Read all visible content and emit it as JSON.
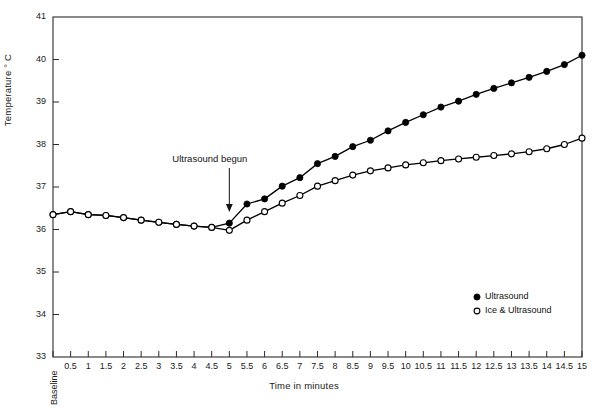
{
  "chart_data": {
    "type": "line",
    "title": "",
    "xlabel": "Time in minutes",
    "ylabel": "Temperature ° C",
    "ylim": [
      33,
      41
    ],
    "yticks": [
      33,
      34,
      35,
      36,
      37,
      38,
      39,
      40,
      41
    ],
    "grid": false,
    "legend_position": "lower-right",
    "categories": [
      "Baseline",
      "0.5",
      "1",
      "1.5",
      "2",
      "2.5",
      "3",
      "3.5",
      "4",
      "4.5",
      "5",
      "5.5",
      "6",
      "6.5",
      "7",
      "7.5",
      "8",
      "8.5",
      "9",
      "9.5",
      "10",
      "10.5",
      "11",
      "11.5",
      "12",
      "12.5",
      "13",
      "13.5",
      "14",
      "14.5",
      "15"
    ],
    "annotations": [
      {
        "text": "Ultrasound begun",
        "at_category": "5",
        "marker": "down-arrow"
      }
    ],
    "series": [
      {
        "name": "Ultrasound",
        "marker": "filled-circle",
        "color": "#000000",
        "values": [
          36.35,
          36.42,
          36.35,
          36.33,
          36.28,
          36.22,
          36.17,
          36.12,
          36.08,
          36.05,
          36.15,
          36.6,
          36.72,
          37.02,
          37.22,
          37.55,
          37.72,
          37.95,
          38.1,
          38.32,
          38.52,
          38.7,
          38.88,
          39.02,
          39.18,
          39.32,
          39.45,
          39.58,
          39.72,
          39.88,
          40.1
        ]
      },
      {
        "name": "Ice & Ultrasound",
        "marker": "open-circle",
        "color": "#000000",
        "values": [
          36.35,
          36.42,
          36.35,
          36.33,
          36.28,
          36.22,
          36.17,
          36.12,
          36.08,
          36.05,
          35.98,
          36.22,
          36.42,
          36.62,
          36.8,
          37.02,
          37.15,
          37.28,
          37.38,
          37.45,
          37.52,
          37.57,
          37.62,
          37.66,
          37.7,
          37.74,
          37.78,
          37.83,
          37.9,
          38.0,
          38.15
        ]
      }
    ]
  },
  "legend": {
    "items": [
      {
        "label": "Ultrasound",
        "marker": "filled-circle"
      },
      {
        "label": "Ice & Ultrasound",
        "marker": "open-circle"
      }
    ]
  }
}
